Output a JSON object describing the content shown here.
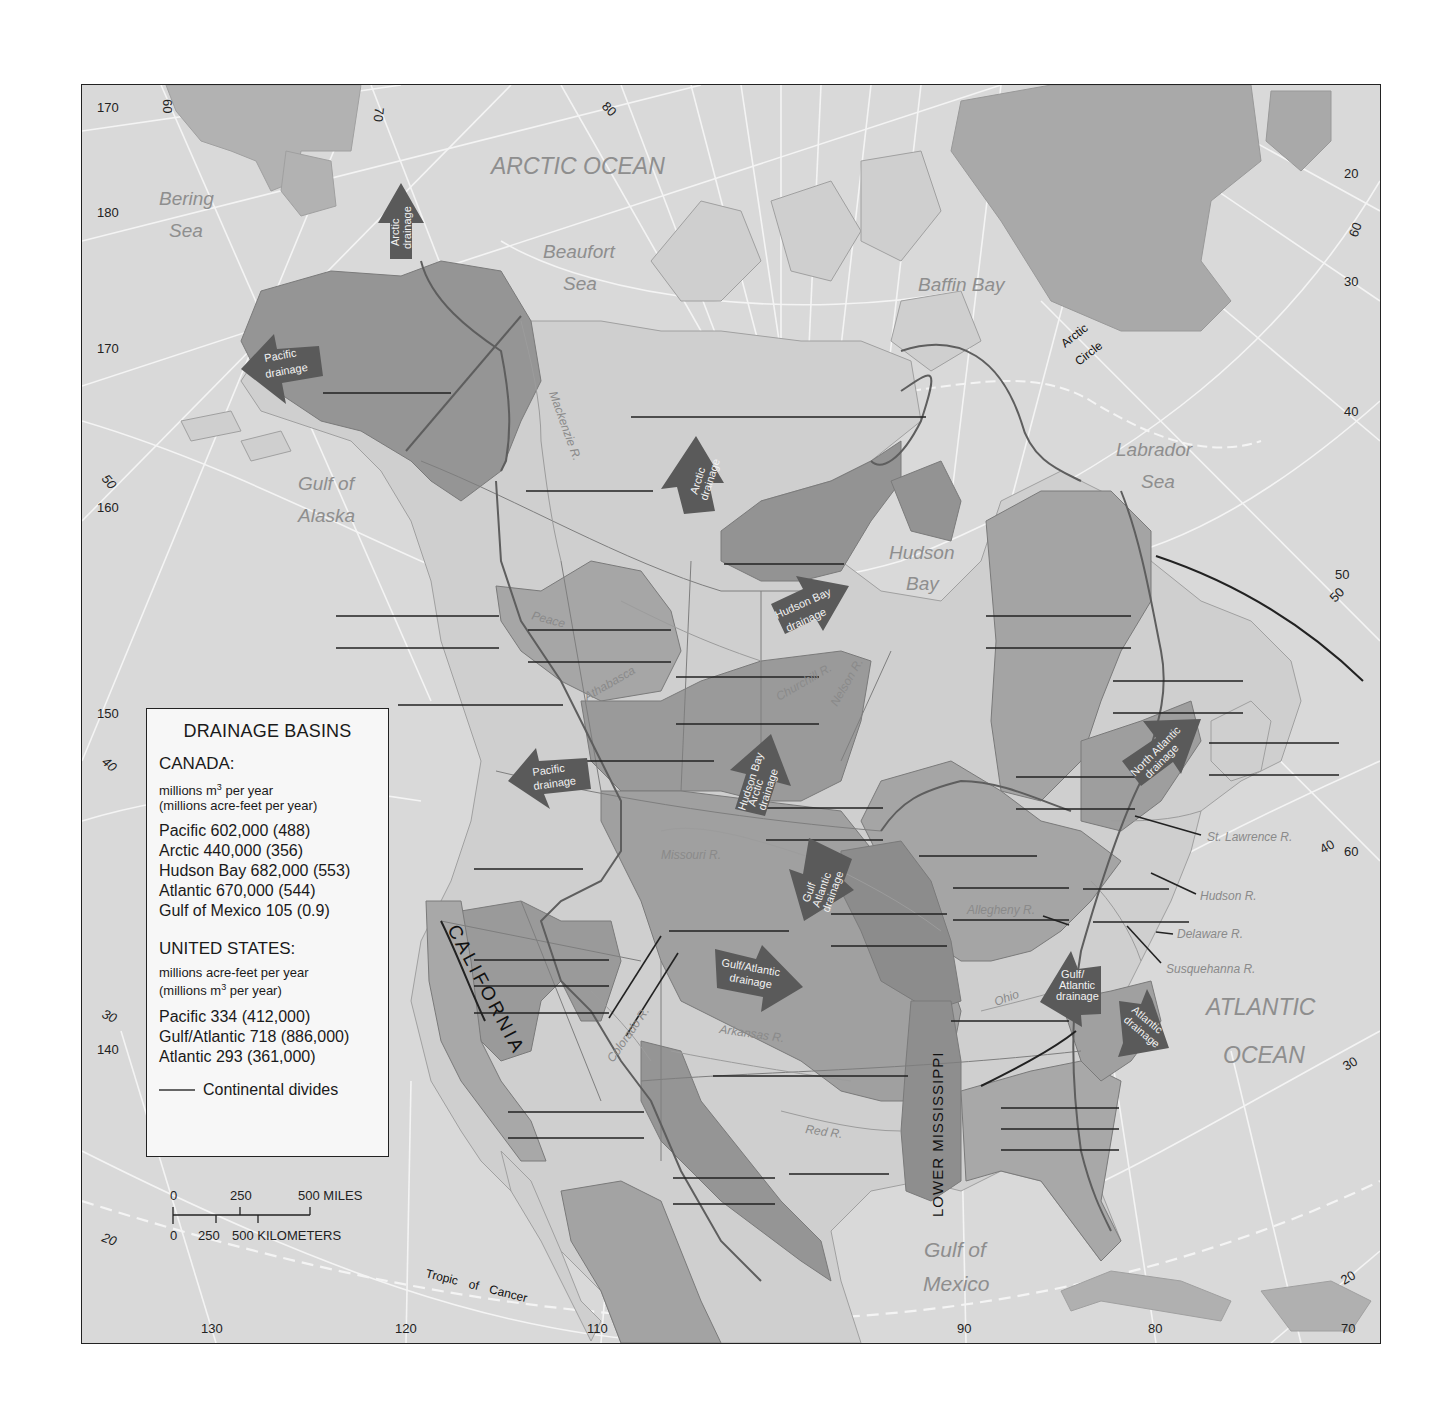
{
  "map": {
    "legend": {
      "title": "DRAINAGE BASINS",
      "canada": {
        "heading": "CANADA:",
        "units_line1": "millions m",
        "units_sup": "3",
        "units_line1_tail": " per year",
        "units_line2": "(millions acre-feet per year)",
        "rows": [
          "Pacific 602,000 (488)",
          "Arctic 440,000 (356)",
          "Hudson Bay 682,000 (553)",
          "Atlantic 670,000 (544)",
          "Gulf of Mexico 105 (0.9)"
        ]
      },
      "united_states": {
        "heading": "UNITED STATES:",
        "units_line1": "millions  acre-feet per year",
        "units_line2_head": "(millions m",
        "units_sup": "3",
        "units_line2_tail": " per year)",
        "rows": [
          "Pacific 334 (412,000)",
          "Gulf/Atlantic 718 (886,000)",
          "Atlantic 293 (361,000)"
        ]
      },
      "divides_label": "Continental divides"
    },
    "scale": {
      "miles": [
        "0",
        "250",
        "500 MILES"
      ],
      "kilometers": [
        "0",
        "250",
        "500 KILOMETERS"
      ]
    },
    "water_bodies": {
      "arctic_ocean": "ARCTIC OCEAN",
      "bering_1": "Bering",
      "bering_2": "Sea",
      "beaufort_1": "Beaufort",
      "beaufort_2": "Sea",
      "baffin": "Baffin Bay",
      "labrador_1": "Labrador",
      "labrador_2": "Sea",
      "hudson_1": "Hudson",
      "hudson_2": "Bay",
      "alaska_1": "Gulf of",
      "alaska_2": "Alaska",
      "atlantic_1": "ATLANTIC",
      "atlantic_2": "OCEAN",
      "mexico_1": "Gulf of",
      "mexico_2": "Mexico"
    },
    "regions": {
      "california": "CALIFORNIA",
      "lower_mississippi": "LOWER MISSISSIPPI"
    },
    "other_labels": {
      "arctic_circle_1": "Arctic",
      "arctic_circle_2": "Circle",
      "tropic_of_cancer": "Tropic of Cancer"
    },
    "rivers": {
      "st_lawrence": "St. Lawrence R.",
      "hudson": "Hudson R.",
      "delaware": "Delaware R.",
      "susquehanna": "Susquehanna R.",
      "arkansas": "Arkansas R.",
      "red": "Red R.",
      "colorado": "Colorado R.",
      "missouri": "Missouri R.",
      "ohio": "Ohio",
      "allegheny": "Allegheny R.",
      "mackenzie": "Mackenzie R.",
      "athabasca": "Athabasca",
      "nelson": "Nelson R.",
      "churchill": "Churchill R.",
      "peace": "Peace"
    },
    "drainage_arrows": {
      "arctic_alaska": [
        "Arctic",
        "drainage"
      ],
      "pacific_alaska": [
        "Pacific",
        "drainage"
      ],
      "arctic_canada": [
        "Arctic",
        "drainage"
      ],
      "hudson_bay": [
        "Hudson Bay",
        "drainage"
      ],
      "pacific_bc": [
        "Pacific",
        "drainage"
      ],
      "hudson_bay_arctic": [
        "Hudson Bay",
        "Arctic",
        "drainage"
      ],
      "north_atlantic": [
        "North Atlantic",
        "drainage"
      ],
      "gulf_atlantic_north": [
        "Gulf",
        "Atlantic",
        "drainage"
      ],
      "gulf_atlantic_central": [
        "Gulf/Atlantic",
        "drainage"
      ],
      "gulf_atlantic_east": [
        "Gulf/",
        "Atlantic",
        "drainage"
      ],
      "atlantic_east": [
        "Atlantic",
        "drainage"
      ]
    },
    "grid_labels": {
      "left": [
        "170",
        "180",
        "170",
        "160",
        "150",
        "140"
      ],
      "left_lat": [
        "50",
        "40",
        "30",
        "20"
      ],
      "top": [
        "60",
        "70",
        "80"
      ],
      "right": [
        "20",
        "30",
        "40",
        "50",
        "60"
      ],
      "right_lat": [
        "60",
        "50",
        "40",
        "30",
        "20"
      ],
      "bottom": [
        "130",
        "120",
        "110",
        "90",
        "80",
        "70"
      ]
    },
    "colors": {
      "ocean": "#d9d9d9",
      "land_light": "#cfcfcf",
      "basin_medium": "#a9a9a9",
      "basin_dark": "#8f8f8f",
      "arrow": "#5a5a5a",
      "graticule": "#f4f4f4",
      "divide": "#5e5e5e",
      "water_label": "#8e8e8e"
    }
  }
}
